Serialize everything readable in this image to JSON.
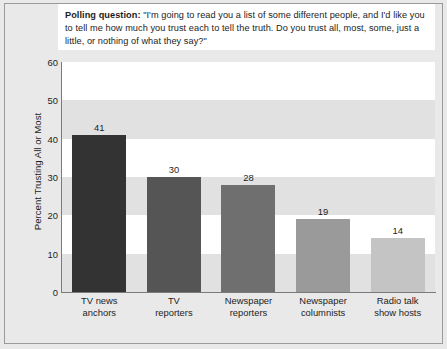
{
  "question": {
    "lead": "Polling question:",
    "body": " \"I'm going to read you a list of some different people, and I'd like you to tell me how much you trust each to tell the truth. Do you trust all, most, some, just a little, or nothing of what they say?\""
  },
  "chart_data": {
    "type": "bar",
    "title": "",
    "xlabel": "",
    "ylabel": "Percent Trusting All or Most",
    "categories": [
      "TV news anchors",
      "TV reporters",
      "Newspaper reporters",
      "Newspaper columnists",
      "Radio talk show hosts"
    ],
    "category_lines": [
      [
        "TV news",
        "anchors"
      ],
      [
        "TV",
        "reporters"
      ],
      [
        "Newspaper",
        "reporters"
      ],
      [
        "Newspaper",
        "columnists"
      ],
      [
        "Radio talk",
        "show hosts"
      ]
    ],
    "values": [
      41,
      30,
      28,
      19,
      14
    ],
    "bar_colors": [
      "#333333",
      "#555555",
      "#6f6f6f",
      "#9a9a9a",
      "#c4c4c4"
    ],
    "ylim": [
      0,
      60
    ],
    "yticks": [
      0,
      10,
      20,
      30,
      40,
      50,
      60
    ],
    "grid": "alternating-horizontal-bands",
    "legend": "none"
  },
  "colors": {
    "figure_background": "#e9e9e9",
    "plot_background": "#e9e9e9",
    "band_light": "#ffffff",
    "band_dark": "#e1e1e1",
    "axis": "#7b7b7b",
    "text": "#1d1d1d",
    "question_box": "#ffffff"
  }
}
